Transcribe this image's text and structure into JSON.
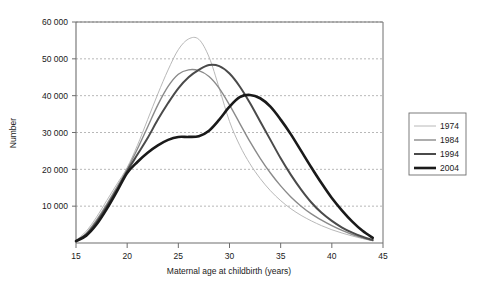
{
  "chart_data": {
    "type": "line",
    "title": "",
    "xlabel": "Maternal age at childbirth (years)",
    "ylabel": "Number",
    "xlim": [
      15,
      45
    ],
    "ylim": [
      0,
      60000
    ],
    "xticks": [
      15,
      20,
      25,
      30,
      35,
      40,
      45
    ],
    "xtick_labels": [
      "15",
      "20",
      "25",
      "30",
      "35",
      "40",
      "45"
    ],
    "yticks": [
      0,
      10000,
      20000,
      30000,
      40000,
      50000,
      60000
    ],
    "ytick_labels": [
      "",
      "10 000",
      "20 000",
      "30 000",
      "40 000",
      "50 000",
      "60 000"
    ],
    "grid": "horizontal-dotted",
    "legend_position": "right-outside",
    "x": [
      15,
      16,
      17,
      18,
      19,
      20,
      21,
      22,
      23,
      24,
      25,
      26,
      27,
      28,
      29,
      30,
      31,
      32,
      33,
      34,
      35,
      36,
      37,
      38,
      39,
      40,
      41,
      42,
      43,
      44
    ],
    "series": [
      {
        "name": "1974",
        "color": "#b0b0b0",
        "line_width": 0.9,
        "values": [
          700,
          3200,
          7000,
          11500,
          16000,
          20500,
          26500,
          33500,
          40500,
          47000,
          52500,
          55400,
          55300,
          50500,
          42000,
          33000,
          26500,
          21500,
          17500,
          14200,
          11500,
          9300,
          7500,
          6000,
          4700,
          3600,
          2700,
          1900,
          1200,
          600
        ]
      },
      {
        "name": "1984",
        "color": "#8a8a8a",
        "line_width": 1.4,
        "values": [
          600,
          2600,
          6200,
          10500,
          15200,
          20000,
          25500,
          31500,
          37500,
          42500,
          45800,
          47000,
          46800,
          45200,
          42000,
          37500,
          32500,
          27500,
          23000,
          19000,
          15500,
          12500,
          10000,
          7900,
          6200,
          4700,
          3400,
          2300,
          1400,
          650
        ]
      },
      {
        "name": "1994",
        "color": "#4a4a4a",
        "line_width": 2.0,
        "values": [
          550,
          2300,
          5600,
          9800,
          14500,
          19500,
          24000,
          28500,
          33500,
          38000,
          42000,
          45000,
          47000,
          48300,
          48000,
          46000,
          42500,
          38000,
          33000,
          28000,
          23000,
          18500,
          14500,
          11000,
          8200,
          6000,
          4200,
          2800,
          1700,
          800
        ]
      },
      {
        "name": "2004",
        "color": "#1a1a1a",
        "line_width": 2.6,
        "values": [
          500,
          2000,
          5000,
          9200,
          14000,
          19000,
          22000,
          24500,
          26500,
          28000,
          28800,
          28800,
          29000,
          30500,
          33500,
          37000,
          39600,
          40200,
          39300,
          37000,
          33500,
          29500,
          25000,
          20500,
          16200,
          12200,
          8800,
          5800,
          3300,
          1400
        ]
      }
    ]
  },
  "legend": {
    "items": [
      {
        "label": "1974"
      },
      {
        "label": "1984"
      },
      {
        "label": "1994"
      },
      {
        "label": "2004"
      }
    ]
  }
}
